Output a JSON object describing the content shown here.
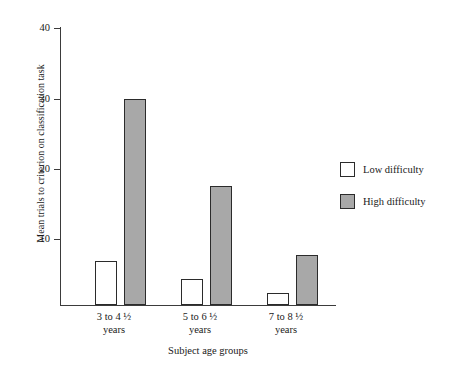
{
  "chart_data": {
    "type": "bar",
    "title": "",
    "xlabel": "Subject age groups",
    "ylabel": "Mean trials to criterion on classification task",
    "categories": [
      "3 to 4 ½ years",
      "5 to 6 ½ years",
      "7 to 8 ½ years"
    ],
    "category_lines": [
      {
        "line1": "3 to 4 ½",
        "line2": "years"
      },
      {
        "line1": "5 to 6 ½",
        "line2": "years"
      },
      {
        "line1": "7 to 8 ½",
        "line2": "years"
      }
    ],
    "series": [
      {
        "name": "Low difficulty",
        "color": "#ffffff",
        "values": [
          6.3,
          3.7,
          1.7
        ]
      },
      {
        "name": "High difficulty",
        "color": "#a8a8a8",
        "values": [
          29.5,
          17.0,
          7.1
        ]
      }
    ],
    "ylim": [
      0,
      40
    ],
    "yticks": [
      10,
      20,
      30,
      40
    ],
    "ytick_labels": [
      "10",
      "20",
      "30",
      "40"
    ],
    "grid": false,
    "legend_position": "right",
    "legend": [
      {
        "label": "Low difficulty",
        "color": "#ffffff"
      },
      {
        "label": "High difficulty",
        "color": "#a8a8a8"
      }
    ]
  },
  "axes": {
    "y_title": "Mean trials to criterion on classification task",
    "x_title": "Subject age groups",
    "tick_40": "40",
    "tick_30": "30",
    "tick_20": "20",
    "tick_10": "10"
  },
  "legend": {
    "low_label": "Low difficulty",
    "high_label": "High difficulty"
  },
  "groups": [
    {
      "line1": "3 to 4 ½",
      "line2": "years"
    },
    {
      "line1": "5 to 6 ½",
      "line2": "years"
    },
    {
      "line1": "7 to 8 ½",
      "line2": "years"
    }
  ],
  "colors": {
    "high_difficulty_fill": "#a8a8a8",
    "low_difficulty_fill": "#ffffff",
    "outline": "#2b2b2b",
    "axis": "#3b3b3b"
  }
}
